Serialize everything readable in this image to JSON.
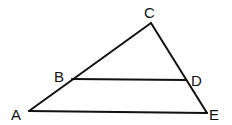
{
  "diagram": {
    "type": "geometry-triangle",
    "stroke_color": "#111111",
    "background": "#ffffff",
    "points": {
      "A": {
        "label": "A",
        "x": 29,
        "y": 111
      },
      "B": {
        "label": "B",
        "x": 72,
        "y": 79
      },
      "C": {
        "label": "C",
        "x": 151,
        "y": 23
      },
      "D": {
        "label": "D",
        "x": 186,
        "y": 80
      },
      "E": {
        "label": "E",
        "x": 207,
        "y": 113
      }
    },
    "segments": [
      {
        "from": "A",
        "to": "C"
      },
      {
        "from": "C",
        "to": "E"
      },
      {
        "from": "A",
        "to": "E"
      },
      {
        "from": "B",
        "to": "D"
      }
    ],
    "labels": [
      {
        "text": "A",
        "x": 11,
        "y": 120
      },
      {
        "text": "B",
        "x": 54,
        "y": 82
      },
      {
        "text": "C",
        "x": 144,
        "y": 18
      },
      {
        "text": "D",
        "x": 191,
        "y": 86
      },
      {
        "text": "E",
        "x": 209,
        "y": 120
      }
    ]
  }
}
